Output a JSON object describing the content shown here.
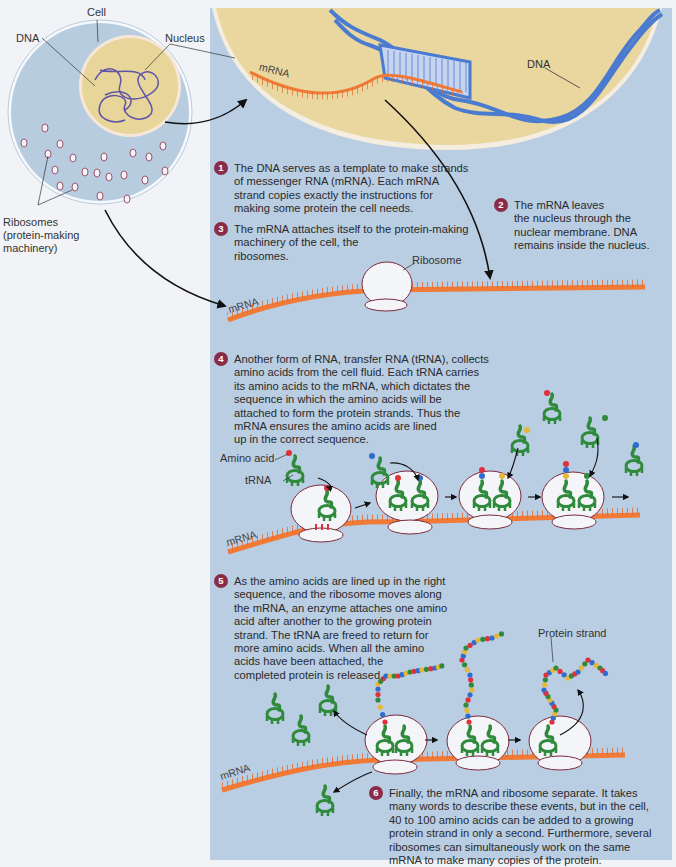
{
  "labels": {
    "cell": "Cell",
    "dna_left": "DNA",
    "nucleus": "Nucleus",
    "ribosomes": "Ribosomes",
    "ribosomes_sub1": "(protein-making",
    "ribosomes_sub2": "machinery)",
    "dna_right": "DNA",
    "mrna": "mRNA",
    "ribosome": "Ribosome",
    "amino_acid": "Amino acid",
    "trna": "tRNA",
    "protein_strand": "Protein strand"
  },
  "steps": [
    {
      "num": "1",
      "lines": [
        "The DNA serves as a template to make strands",
        "of messenger RNA (mRNA). Each mRNA",
        "strand copies exactly the instructions for",
        "making some protein the cell needs."
      ]
    },
    {
      "num": "2",
      "lines": [
        "The mRNA leaves",
        "the nucleus through the",
        "nuclear membrane. DNA",
        "remains inside the nucleus."
      ]
    },
    {
      "num": "3",
      "lines": [
        "The mRNA attaches itself to the protein-making",
        "machinery of the cell, the",
        "ribosomes."
      ]
    },
    {
      "num": "4",
      "lines": [
        "Another form of RNA, transfer RNA (tRNA), collects",
        "amino acids from the cell fluid. Each tRNA carries",
        "its amino acids to the mRNA, which dictates the",
        "sequence in which the amino acids will be",
        "attached to form the protein strands. Thus the",
        "mRNA ensures the amino acids are lined",
        "up in the correct sequence."
      ]
    },
    {
      "num": "5",
      "lines": [
        "As the amino acids are lined up in the right",
        "sequence, and the ribosome moves along",
        "the mRNA, an enzyme attaches one amino",
        "acid after another to the growing protein",
        "strand. The tRNA are freed to return for",
        "more amino acids. When all the amino",
        "acids have been attached, the",
        "completed protein is released."
      ]
    },
    {
      "num": "6",
      "lines": [
        "Finally, the mRNA and ribosome separate. It takes",
        "many words to describe these events, but in the cell,",
        "40 to 100 amino acids can be added to a growing",
        "protein strand in only a second. Furthermore, several",
        "ribosomes can simultaneously work on the same",
        "mRNA to make many copies of the protein."
      ]
    }
  ],
  "colors": {
    "panel": "#b9cde3",
    "cell_fill": "#b8cce0",
    "nucleus_fill": "#e8d599",
    "dna": "#4a7bd0",
    "mrna": "#f07a36",
    "trna": "#2f8a3c",
    "ribosome": "#f4f5f8",
    "ribosome_border": "#7e2a3c",
    "step_badge": "#8a2c48",
    "amino_red": "#e0303a",
    "amino_blue": "#2f6cd0",
    "amino_yellow": "#e6b83a",
    "amino_green": "#2f8a3c"
  }
}
